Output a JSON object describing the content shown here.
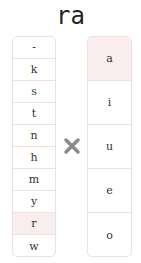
{
  "title": "ra",
  "consonants": [
    "-",
    "k",
    "s",
    "t",
    "n",
    "h",
    "m",
    "y",
    "r",
    "w"
  ],
  "vowels": [
    "a",
    "i",
    "u",
    "e",
    "o"
  ],
  "selected_consonant": "r",
  "selected_vowel": "a",
  "operator_icon": "times-icon",
  "colors": {
    "selected_bg": "#f9eded",
    "border": "#f0e0e0",
    "operator": "#8a8a8a"
  }
}
